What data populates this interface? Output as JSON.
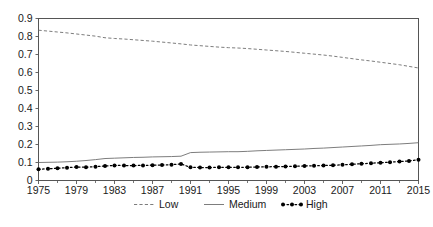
{
  "chart_data": {
    "type": "line",
    "title": "",
    "xlabel": "",
    "ylabel": "",
    "xlim": [
      1975,
      2015
    ],
    "ylim": [
      0,
      0.9
    ],
    "grid": false,
    "legend_position": "bottom",
    "y_ticks": [
      "0",
      "0.1",
      "0.2",
      "0.3",
      "0.4",
      "0.5",
      "0.6",
      "0.7",
      "0.8",
      "0.9"
    ],
    "y_tick_values": [
      0,
      0.1,
      0.2,
      0.3,
      0.4,
      0.5,
      0.6,
      0.7,
      0.8,
      0.9
    ],
    "x_tick_labels": [
      "1975",
      "1979",
      "1983",
      "1987",
      "1991",
      "1995",
      "1999",
      "2003",
      "2007",
      "2011",
      "2015"
    ],
    "x_tick_values": [
      1975,
      1979,
      1983,
      1987,
      1991,
      1995,
      1999,
      2003,
      2007,
      2011,
      2015
    ],
    "x_minor_tick_values": [
      1977,
      1981,
      1985,
      1989,
      1993,
      1997,
      2001,
      2005,
      2009,
      2013
    ],
    "x": [
      1975,
      1976,
      1977,
      1978,
      1979,
      1980,
      1981,
      1982,
      1983,
      1984,
      1985,
      1986,
      1987,
      1988,
      1989,
      1990,
      1991,
      1992,
      1993,
      1994,
      1995,
      1996,
      1997,
      1998,
      1999,
      2000,
      2001,
      2002,
      2003,
      2004,
      2005,
      2006,
      2007,
      2008,
      2009,
      2010,
      2011,
      2012,
      2013,
      2014,
      2015
    ],
    "series": [
      {
        "name": "Low",
        "style": "dashed",
        "color": "#6e6e6e",
        "marker": "none",
        "values": [
          0.835,
          0.83,
          0.825,
          0.82,
          0.814,
          0.808,
          0.802,
          0.793,
          0.789,
          0.786,
          0.782,
          0.778,
          0.774,
          0.769,
          0.764,
          0.759,
          0.753,
          0.749,
          0.745,
          0.741,
          0.738,
          0.736,
          0.733,
          0.729,
          0.725,
          0.721,
          0.717,
          0.712,
          0.707,
          0.702,
          0.697,
          0.691,
          0.684,
          0.677,
          0.67,
          0.664,
          0.657,
          0.65,
          0.643,
          0.634,
          0.625
        ]
      },
      {
        "name": "Medium",
        "style": "solid",
        "color": "#6e6e6e",
        "marker": "none",
        "values": [
          0.1,
          0.101,
          0.102,
          0.104,
          0.107,
          0.111,
          0.116,
          0.122,
          0.124,
          0.126,
          0.128,
          0.129,
          0.131,
          0.132,
          0.133,
          0.135,
          0.155,
          0.157,
          0.158,
          0.159,
          0.16,
          0.16,
          0.162,
          0.165,
          0.167,
          0.169,
          0.171,
          0.173,
          0.175,
          0.178,
          0.18,
          0.183,
          0.186,
          0.189,
          0.192,
          0.195,
          0.199,
          0.201,
          0.203,
          0.206,
          0.21
        ]
      },
      {
        "name": "High",
        "style": "dotted",
        "color": "#000000",
        "marker": "circle",
        "values": [
          0.063,
          0.065,
          0.068,
          0.071,
          0.075,
          0.074,
          0.077,
          0.08,
          0.084,
          0.083,
          0.083,
          0.084,
          0.085,
          0.086,
          0.088,
          0.092,
          0.073,
          0.072,
          0.072,
          0.073,
          0.073,
          0.073,
          0.074,
          0.075,
          0.076,
          0.077,
          0.078,
          0.079,
          0.081,
          0.082,
          0.083,
          0.085,
          0.087,
          0.09,
          0.093,
          0.096,
          0.099,
          0.102,
          0.105,
          0.109,
          0.115
        ]
      }
    ]
  },
  "legend": {
    "items": [
      {
        "label": "Low"
      },
      {
        "label": "Medium"
      },
      {
        "label": "High"
      }
    ]
  },
  "axes": {
    "frame_color": "#555555"
  }
}
